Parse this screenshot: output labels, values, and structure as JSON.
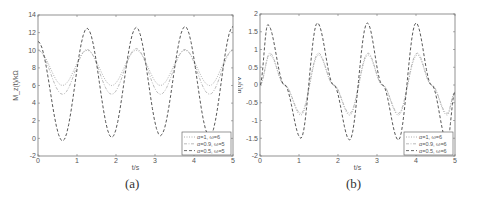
{
  "figure": {
    "panels": [
      {
        "caption": "(a)"
      },
      {
        "caption": "(b)"
      }
    ]
  },
  "chart_data": [
    {
      "type": "line",
      "title": "",
      "panel_label": "(a)",
      "xlabel": "t/s",
      "ylabel": "M_z(t)/kΩ",
      "xlim": [
        0,
        5
      ],
      "ylim": [
        -2,
        14
      ],
      "xticks": [
        0,
        1,
        2,
        3,
        4,
        5
      ],
      "yticks": [
        -2,
        0,
        2,
        4,
        6,
        8,
        10,
        12,
        14
      ],
      "grid": false,
      "legend_position": "lower right",
      "series": [
        {
          "name": "α=1, ω=6",
          "style": "dotted",
          "description": "oscillates between ~6 and ~10, period ~1.26 s",
          "x": [
            0,
            0.63,
            1.26,
            1.89,
            2.52,
            3.14,
            3.77,
            4.4,
            5.0
          ],
          "values": [
            10,
            6,
            10,
            6,
            10,
            6,
            10,
            6,
            10
          ]
        },
        {
          "name": "α=0.9, ω=5",
          "style": "dash-dot",
          "description": "oscillates between ~5 and ~10.2",
          "x": [
            0,
            0.63,
            1.26,
            1.89,
            2.52,
            3.14,
            3.77,
            4.4,
            5.0
          ],
          "values": [
            10,
            5,
            10.1,
            5,
            10.2,
            5,
            10.1,
            5,
            10
          ]
        },
        {
          "name": "α=0.5, ω=5",
          "style": "dashed",
          "description": "oscillates between ~0 and ~12.5",
          "x": [
            0,
            0.63,
            1.26,
            1.89,
            2.52,
            3.14,
            3.77,
            4.4,
            5.0
          ],
          "values": [
            11,
            -0.3,
            12.5,
            0.1,
            12.6,
            0.3,
            12.7,
            0.2,
            12.7
          ]
        }
      ]
    },
    {
      "type": "line",
      "title": "",
      "panel_label": "(b)",
      "xlabel": "t/s",
      "ylabel": "u(t)/V",
      "xlim": [
        0,
        5
      ],
      "ylim": [
        -2,
        2
      ],
      "xticks": [
        0,
        1,
        2,
        3,
        4,
        5
      ],
      "yticks": [
        -2,
        -1.5,
        -1,
        -0.5,
        0,
        0.5,
        1,
        1.5,
        2
      ],
      "grid": false,
      "legend_position": "lower right",
      "series": [
        {
          "name": "α=1, ω=6",
          "style": "dotted",
          "description": "amplitude ~0.85, period ~1.26 s",
          "x": [
            0,
            0.25,
            0.63,
            1.05,
            1.5,
            1.89,
            2.3,
            2.77,
            3.14,
            3.55,
            4.03,
            4.4,
            4.8,
            5.0
          ],
          "values": [
            0,
            0.85,
            0,
            -0.85,
            0.85,
            0,
            -0.85,
            0.85,
            0,
            -0.85,
            0.85,
            0,
            -0.85,
            -0.2
          ]
        },
        {
          "name": "α=0.9, ω=6",
          "style": "dash-dot",
          "description": "amplitude ~0.9",
          "x": [
            0,
            0.25,
            0.63,
            1.05,
            1.5,
            1.89,
            2.3,
            2.77,
            3.14,
            3.55,
            4.03,
            4.4,
            4.8,
            5.0
          ],
          "values": [
            0,
            0.9,
            0,
            -0.8,
            0.9,
            0,
            -0.8,
            0.9,
            0,
            -0.8,
            0.9,
            0,
            -0.8,
            -0.2
          ]
        },
        {
          "name": "α=0.5, ω=6",
          "style": "dashed",
          "description": "amplitude ~1.7",
          "x": [
            0,
            0.2,
            0.63,
            1.05,
            1.47,
            1.89,
            2.3,
            2.75,
            3.14,
            3.55,
            4.0,
            4.4,
            4.8,
            5.0
          ],
          "values": [
            0,
            1.7,
            0,
            -1.5,
            1.75,
            0,
            -1.55,
            1.75,
            0,
            -1.55,
            1.75,
            0,
            -1.6,
            -0.2
          ]
        }
      ]
    }
  ]
}
